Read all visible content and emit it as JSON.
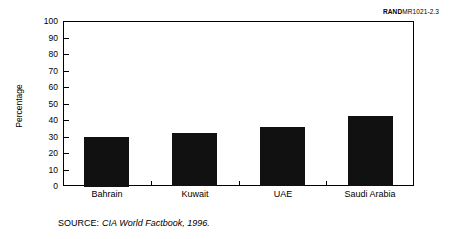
{
  "rand_id": {
    "bold_part": "RAND",
    "rest_part": "MR1021-2.3"
  },
  "source_note": {
    "label": "SOURCE:",
    "title": "CIA World Factbook, 1996."
  },
  "chart_data": {
    "type": "bar",
    "title": "",
    "subtitle": "",
    "xlabel": "",
    "ylabel": "Percentage",
    "categories": [
      "Bahrain",
      "Kuwait",
      "UAE",
      "Saudi Arabia"
    ],
    "values": [
      30,
      32,
      36,
      42.5
    ],
    "series": [
      {
        "name": "Percentage",
        "values": [
          30,
          32,
          36,
          42.5
        ],
        "color": "#111111"
      }
    ],
    "ylim": [
      0,
      100
    ],
    "ytick_values": [
      100,
      90,
      80,
      70,
      60,
      50,
      40,
      30,
      20,
      10,
      0
    ],
    "ytick_labels": [
      "100",
      "90",
      "80",
      "70",
      "60",
      "50",
      "40",
      "30",
      "20",
      "10",
      "0"
    ],
    "grid": false,
    "legend": false,
    "legend_position": "none",
    "frame": "box",
    "bar_color": "#111111",
    "background_color": "#ffffff"
  }
}
